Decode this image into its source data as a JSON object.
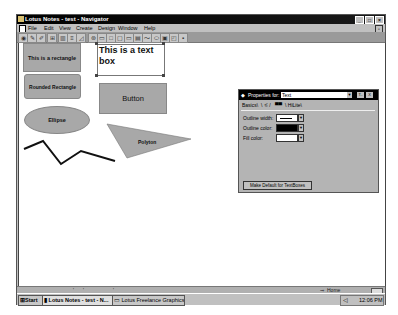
{
  "window": {
    "title": "Lotus Notes - test - Navigator",
    "controls": [
      "minimize",
      "maximize",
      "close"
    ]
  },
  "menubar": {
    "items": [
      "File",
      "Edit",
      "View",
      "Create",
      "Design",
      "Window",
      "Help"
    ]
  },
  "toolbar": {
    "icons": [
      "navigator-icon",
      "edit-icon",
      "pencil-icon",
      "grid-icon",
      "open-icon",
      "list-icon",
      "chart-icon",
      "hotspot-icon",
      "text-icon",
      "rectangle-icon",
      "rounded-rectangle-icon",
      "ellipse-icon",
      "folder-icon",
      "polyline-icon",
      "polygon-icon",
      "graphic-button-icon",
      "snap-icon",
      "properties-icon"
    ]
  },
  "canvas": {
    "shapes": {
      "rectangle": "This is a rectangle",
      "rounded_rectangle": "Rounded Rectangle",
      "text_box": "This is a text box",
      "button": "Button",
      "ellipse": "Ellipse",
      "polygon": "Polyton"
    }
  },
  "properties": {
    "title": "Properties for:",
    "selected": "Text",
    "tabs": [
      "Basics",
      "Font",
      "Fill",
      "HiLite"
    ],
    "rows": [
      {
        "label": "Outline width:",
        "value": "thin"
      },
      {
        "label": "Outline color:",
        "value": "#000000"
      },
      {
        "label": "Fill color:",
        "value": "#ffffff"
      }
    ],
    "make_default": "Make Default for TextBoxes",
    "help_btn": "T..",
    "close_btn": "X"
  },
  "statusbar": {
    "location": "Home"
  },
  "taskbar": {
    "start": "Start",
    "tasks": [
      "Lotus Notes - test - N...",
      "Lotus Freelance Graphics -"
    ],
    "clock": "12:06 PM"
  },
  "colors": {
    "shape_fill": "#a8a8a8",
    "titlebar": "#000000",
    "chrome": "#c0c0c0"
  }
}
